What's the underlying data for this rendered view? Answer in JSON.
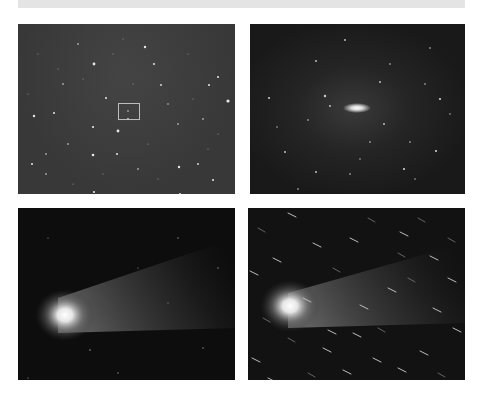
{
  "figure": {
    "panels": [
      {
        "id": "top-left",
        "description": "Wide star field with small rectangle marking comet position",
        "marker_box": true
      },
      {
        "id": "top-right",
        "description": "Zoomed star field with elongated bright comet nucleus at center"
      },
      {
        "id": "bottom-left",
        "description": "Comet with bright coma and diffuse tail extending to upper right"
      },
      {
        "id": "bottom-right",
        "description": "Comet with coma and tail; stars appear as short streaks"
      }
    ],
    "colors": {
      "background": "#ffffff",
      "top_bar": "#e4e4e4",
      "marker": "#bdbdbd"
    }
  }
}
